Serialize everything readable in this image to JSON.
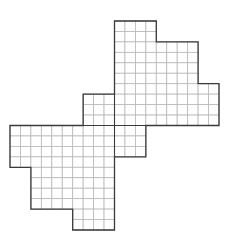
{
  "figure": {
    "title": "",
    "grid": {
      "columns": 20,
      "rows": 20
    },
    "row_spans": [
      {
        "rows": [
          0,
          1
        ],
        "cols": [
          10,
          13
        ]
      },
      {
        "rows": [
          2,
          5
        ],
        "cols": [
          10,
          17
        ]
      },
      {
        "rows": [
          6,
          6
        ],
        "cols": [
          10,
          19
        ]
      },
      {
        "rows": [
          7,
          9
        ],
        "cols": [
          7,
          19
        ]
      },
      {
        "rows": [
          10,
          12
        ],
        "cols": [
          0,
          12
        ]
      },
      {
        "rows": [
          13,
          13
        ],
        "cols": [
          0,
          9
        ]
      },
      {
        "rows": [
          14,
          17
        ],
        "cols": [
          2,
          9
        ]
      },
      {
        "rows": [
          18,
          19
        ],
        "cols": [
          6,
          9
        ]
      }
    ],
    "outline": [
      [
        10,
        0
      ],
      [
        14,
        0
      ],
      [
        14,
        2
      ],
      [
        18,
        2
      ],
      [
        18,
        6
      ],
      [
        20,
        6
      ],
      [
        20,
        10
      ],
      [
        13,
        10
      ],
      [
        13,
        13
      ],
      [
        10,
        13
      ],
      [
        10,
        20
      ],
      [
        6,
        20
      ],
      [
        6,
        18
      ],
      [
        2,
        18
      ],
      [
        2,
        14
      ],
      [
        0,
        14
      ],
      [
        0,
        10
      ],
      [
        7,
        10
      ],
      [
        7,
        7
      ],
      [
        10,
        7
      ],
      [
        10,
        0
      ]
    ],
    "dividers": [
      [
        [
          10,
          7
        ],
        [
          10,
          13
        ]
      ],
      [
        [
          7,
          10
        ],
        [
          13,
          10
        ]
      ]
    ],
    "colors": {
      "outline": "#3a3a3a",
      "grid": "#b8b8b8",
      "fill": "#ffffff"
    }
  }
}
